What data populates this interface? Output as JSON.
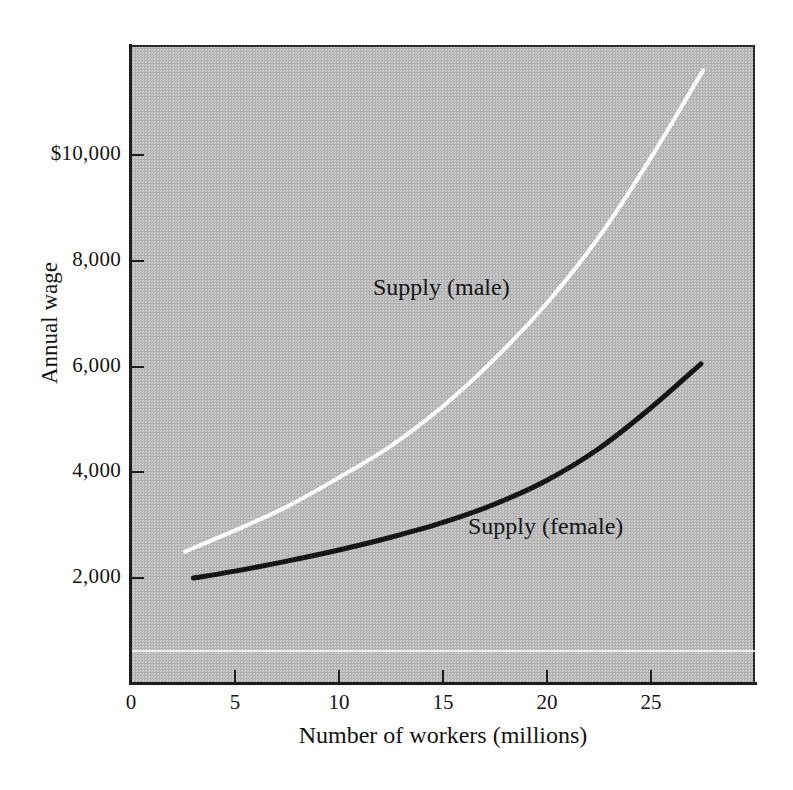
{
  "chart_data": {
    "type": "line",
    "title": "",
    "subtitle": "",
    "xlabel": "Number of workers (millions)",
    "ylabel": "Annual wage",
    "xlim": [
      0,
      30
    ],
    "ylim": [
      0,
      11600
    ],
    "xticks": [
      0,
      5,
      10,
      15,
      20,
      25
    ],
    "xtick_labels": [
      "0",
      "5",
      "10",
      "15",
      "20",
      "25"
    ],
    "yticks": [
      2000,
      4000,
      6000,
      8000,
      10000
    ],
    "ytick_labels": [
      "2,000",
      "4,000",
      "6,000",
      "8,000",
      "$10,000"
    ],
    "grid": false,
    "legend_position": "inline-annotation",
    "background_color": "#b9b9b9",
    "series": [
      {
        "name": "Supply (male)",
        "label_text": "Supply (male)",
        "color": "#ffffff",
        "line_width": 4,
        "x": [
          2.6,
          5,
          7.5,
          10,
          12.5,
          15,
          17.5,
          20,
          22.5,
          25,
          27.5
        ],
        "y": [
          2500,
          2900,
          3350,
          3900,
          4500,
          5250,
          6150,
          7200,
          8450,
          9950,
          11600
        ]
      },
      {
        "name": "Supply (female)",
        "label_text": "Supply (female)",
        "color": "#151515",
        "line_width": 5,
        "x": [
          3.0,
          5,
          7.5,
          10,
          12.5,
          15,
          17.5,
          20,
          22.5,
          25,
          27.4
        ],
        "y": [
          2000,
          2130,
          2320,
          2530,
          2770,
          3050,
          3400,
          3850,
          4450,
          5220,
          6050
        ]
      }
    ]
  },
  "axes": {
    "y_title": "Annual wage",
    "x_title": "Number of workers (millions)"
  },
  "annotations": {
    "supply_male": "Supply (male)",
    "supply_female": "Supply (female)"
  },
  "ytick_labels": [
    "$10,000",
    "8,000",
    "6,000",
    "4,000",
    "2,000"
  ],
  "xtick_labels": [
    "0",
    "5",
    "10",
    "15",
    "20",
    "25"
  ]
}
